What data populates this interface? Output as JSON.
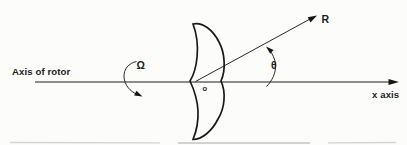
{
  "figure": {
    "background": "#fcfcfb",
    "ink_color": "#1d1d1d",
    "labels": {
      "axis_of_rotor": "Axis of rotor",
      "omega": "Ω",
      "r": "R",
      "theta": "θ",
      "origin": "o",
      "x_axis": "x axis"
    }
  }
}
